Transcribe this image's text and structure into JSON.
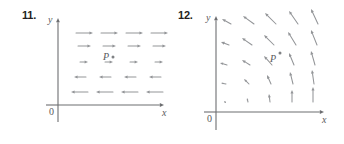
{
  "figure": {
    "kind": "vector-field-diagrams",
    "background_color": "#ffffff",
    "arrow_color": "#939598",
    "axis_color": "#6d6e71",
    "text_color": "#58595b"
  },
  "panels": [
    {
      "number": "11.",
      "y_axis_label": "y",
      "x_axis_label": "x",
      "origin_label": "0",
      "point_label": "P",
      "point_dot": true,
      "description": "Horizontal vector field: arrows point right above P and left below, lengths shrink toward the middle row."
    },
    {
      "number": "12.",
      "y_axis_label": "y",
      "x_axis_label": "x",
      "origin_label": "0",
      "point_label": "P",
      "point_dot": true,
      "description": "Rotational vector field: arrows point up near the x-axis and swing to up-left higher up, growing longer away from the origin."
    }
  ],
  "chart_data": [
    {
      "type": "quiver",
      "title": "11.",
      "xlabel": "x",
      "ylabel": "y",
      "grid": false,
      "origin_px": {
        "x": 58,
        "y": 105
      },
      "axis_extent_px": {
        "x_end": 164,
        "y_top": 18,
        "y_bottom": 122
      },
      "point_P_px": {
        "x": 106,
        "y": 58
      },
      "vectors": [
        {
          "x": 76,
          "y": 33,
          "dx": 17,
          "dy": 0
        },
        {
          "x": 101,
          "y": 33,
          "dx": 17,
          "dy": 0
        },
        {
          "x": 126,
          "y": 33,
          "dx": 17,
          "dy": 0
        },
        {
          "x": 151,
          "y": 33,
          "dx": 17,
          "dy": 0
        },
        {
          "x": 78,
          "y": 46,
          "dx": 13,
          "dy": 0
        },
        {
          "x": 103,
          "y": 46,
          "dx": 13,
          "dy": 0
        },
        {
          "x": 128,
          "y": 46,
          "dx": 13,
          "dy": 0
        },
        {
          "x": 153,
          "y": 46,
          "dx": 13,
          "dy": 0
        },
        {
          "x": 80,
          "y": 62,
          "dx": 8,
          "dy": 0
        },
        {
          "x": 105,
          "y": 62,
          "dx": 8,
          "dy": 0
        },
        {
          "x": 130,
          "y": 62,
          "dx": 8,
          "dy": 0
        },
        {
          "x": 155,
          "y": 62,
          "dx": 8,
          "dy": 0
        },
        {
          "x": 86,
          "y": 77,
          "dx": -12,
          "dy": 0
        },
        {
          "x": 111,
          "y": 77,
          "dx": -12,
          "dy": 0
        },
        {
          "x": 136,
          "y": 77,
          "dx": -12,
          "dy": 0
        },
        {
          "x": 161,
          "y": 77,
          "dx": -12,
          "dy": 0
        },
        {
          "x": 88,
          "y": 92,
          "dx": -17,
          "dy": 0
        },
        {
          "x": 113,
          "y": 92,
          "dx": -17,
          "dy": 0
        },
        {
          "x": 138,
          "y": 92,
          "dx": -17,
          "dy": 0
        },
        {
          "x": 163,
          "y": 92,
          "dx": -17,
          "dy": 0
        }
      ]
    },
    {
      "type": "quiver",
      "title": "12.",
      "xlabel": "x",
      "ylabel": "y",
      "grid": false,
      "origin_px": {
        "x": 44,
        "y": 112
      },
      "axis_extent_px": {
        "x_end": 152,
        "y_top": 16,
        "y_bottom": 130
      },
      "point_P_px": {
        "x": 101,
        "y": 60
      },
      "vectors": [
        {
          "x": 59,
          "y": 24,
          "dx": -9,
          "dy": -5
        },
        {
          "x": 82,
          "y": 24,
          "dx": -11,
          "dy": -8
        },
        {
          "x": 104,
          "y": 24,
          "dx": -11,
          "dy": -11
        },
        {
          "x": 126,
          "y": 24,
          "dx": -9,
          "dy": -13
        },
        {
          "x": 146,
          "y": 24,
          "dx": -7,
          "dy": -15
        },
        {
          "x": 57,
          "y": 45,
          "dx": -8,
          "dy": -3
        },
        {
          "x": 80,
          "y": 45,
          "dx": -10,
          "dy": -7
        },
        {
          "x": 102,
          "y": 45,
          "dx": -10,
          "dy": -10
        },
        {
          "x": 124,
          "y": 45,
          "dx": -8,
          "dy": -13
        },
        {
          "x": 145,
          "y": 45,
          "dx": -6,
          "dy": -15
        },
        {
          "x": 55,
          "y": 65,
          "dx": -7,
          "dy": -2
        },
        {
          "x": 78,
          "y": 65,
          "dx": -8,
          "dy": -5
        },
        {
          "x": 100,
          "y": 65,
          "dx": -8,
          "dy": -9
        },
        {
          "x": 122,
          "y": 65,
          "dx": -5,
          "dy": -12
        },
        {
          "x": 143,
          "y": 65,
          "dx": -4,
          "dy": -14
        },
        {
          "x": 54,
          "y": 84,
          "dx": -5,
          "dy": -1
        },
        {
          "x": 77,
          "y": 84,
          "dx": -5,
          "dy": -5
        },
        {
          "x": 99,
          "y": 84,
          "dx": -4,
          "dy": -9
        },
        {
          "x": 121,
          "y": 84,
          "dx": -3,
          "dy": -12
        },
        {
          "x": 142,
          "y": 84,
          "dx": -2,
          "dy": -14
        },
        {
          "x": 53,
          "y": 102,
          "dx": -1,
          "dy": -1
        },
        {
          "x": 76,
          "y": 102,
          "dx": -1,
          "dy": -4
        },
        {
          "x": 98,
          "y": 102,
          "dx": -1,
          "dy": -8
        },
        {
          "x": 120,
          "y": 102,
          "dx": 0,
          "dy": -12
        },
        {
          "x": 141,
          "y": 102,
          "dx": 0,
          "dy": -15
        }
      ]
    }
  ]
}
